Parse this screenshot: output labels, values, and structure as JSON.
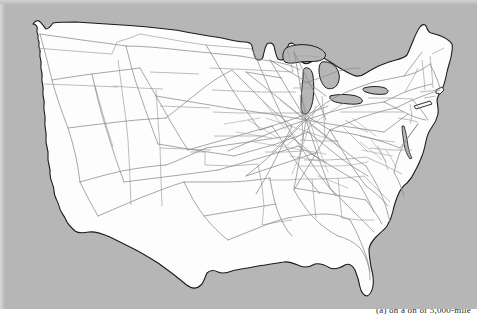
{
  "figure": {
    "kind": "map",
    "background_color": "#b6b6b6",
    "land_color": "#fdfdfd",
    "border_color": "#1a1a1a",
    "state_line_color": "#9a9a9a",
    "network_line_color": "#8c8c8c"
  },
  "caption": {
    "text": "(a) on a on of 5,000-mile",
    "visible": "truncated"
  },
  "regions": [
    {
      "name": "west-coast",
      "label": "West Coast"
    },
    {
      "name": "great-lakes",
      "label": "Great Lakes"
    },
    {
      "name": "northeast",
      "label": "Northeast"
    },
    {
      "name": "florida-peninsula",
      "label": "Florida"
    },
    {
      "name": "texas-gulf-coast",
      "label": "Texas Gulf Coast"
    }
  ],
  "map_data": {
    "type": "outline-network",
    "projection": "conic",
    "country_outline": "M 28,116 L 31,108 L 30,100 L 33,92 L 31,84 L 34,76 L 37,70 L 40,62 L 42,54 L 44,46 L 47,40 L 50,34 L 53,29 L 57,26 L 60,24 L 63,26 L 65,30 L 68,33 L 70,30 L 69,26 L 71,22 L 75,20 L 80,20 L 86,21 L 96,21 L 110,22 L 130,25 L 155,28 L 180,31 L 210,34 L 240,37 L 265,40 L 280,42",
    "line_counts": {
      "dense_hub": "midwest",
      "sparse_region": "mountain-west"
    }
  }
}
